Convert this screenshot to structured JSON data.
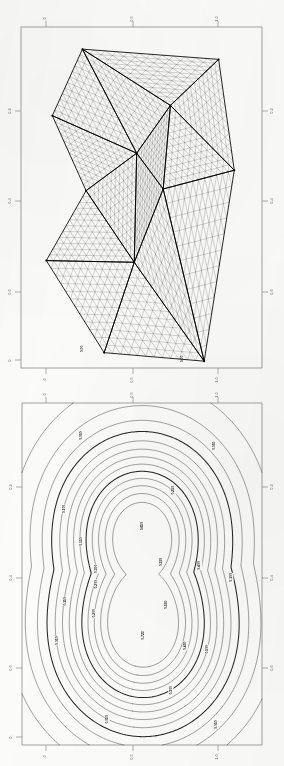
{
  "document": {
    "kind": "scanned-page",
    "background_color": "#fbfbfa",
    "ink_color": "#1b1b1b",
    "axis_color": "#888888",
    "page_width": 284,
    "page_height": 766
  },
  "figures": [
    {
      "id": "mesh-plot",
      "name": "triangular-finite-element-mesh",
      "caption": "",
      "frame": {
        "x": 21,
        "y": 27,
        "width": 241,
        "height": 341
      },
      "axes": {
        "top": {
          "ticks": [
            {
              "label": ".0",
              "pos": 0.105
            },
            {
              "label": "0.5",
              "pos": 0.465
            },
            {
              "label": "1.0",
              "pos": 0.815
            }
          ]
        },
        "bottom": {
          "ticks": [
            {
              "label": ".0",
              "pos": 0.105
            },
            {
              "label": "0.5",
              "pos": 0.465
            },
            {
              "label": "1.0",
              "pos": 0.815
            }
          ]
        },
        "left": {
          "ticks": [
            {
              "label": "0.2",
              "pos": 0.245
            },
            {
              "label": "0.4",
              "pos": 0.51
            },
            {
              "label": "0.6",
              "pos": 0.775
            },
            {
              "label": "0.",
              "pos": 0.975
            }
          ]
        },
        "right": {
          "ticks": [
            {
              "label": "0.2",
              "pos": 0.245
            },
            {
              "label": "0.4",
              "pos": 0.51
            },
            {
              "label": "0.6",
              "pos": 0.775
            }
          ]
        }
      },
      "node_labels": [
        {
          "text": "0.00",
          "x": 0.345,
          "y": 0.958
        },
        {
          "text": "0.00",
          "x": 0.76,
          "y": 0.985
        }
      ]
    },
    {
      "id": "contour-plot",
      "name": "contour-plot-two-peaks",
      "caption": "",
      "frame": {
        "x": 22,
        "y": 403,
        "width": 240,
        "height": 342
      },
      "axes": {
        "top": {
          "ticks": [
            {
              "label": ".0",
              "pos": 0.105
            },
            {
              "label": "0.5",
              "pos": 0.465
            },
            {
              "label": "1.0",
              "pos": 0.815
            }
          ]
        },
        "bottom": {
          "ticks": [
            {
              "label": ".0",
              "pos": 0.105
            },
            {
              "label": "0.5",
              "pos": 0.465
            },
            {
              "label": "1.0",
              "pos": 0.815
            }
          ]
        },
        "left": {
          "ticks": [
            {
              "label": "0.2",
              "pos": 0.245
            },
            {
              "label": "0.4",
              "pos": 0.51
            },
            {
              "label": "0.6",
              "pos": 0.775
            },
            {
              "label": "0.",
              "pos": 0.975
            }
          ]
        },
        "right": {
          "ticks": [
            {
              "label": "0.2",
              "pos": 0.245
            },
            {
              "label": "0.4",
              "pos": 0.51
            },
            {
              "label": "0.6",
              "pos": 0.775
            }
          ]
        }
      }
    }
  ],
  "chart_data": [
    {
      "type": "mesh",
      "title": "",
      "subtitle": "",
      "xlabel": "",
      "ylabel": "",
      "xlim": [
        0.0,
        1.0
      ],
      "ylim": [
        0.0,
        0.8
      ],
      "grid": false,
      "legend": null,
      "description": "Unstructured triangular finite-element mesh on a convex polygonal domain, subdivided into macro-triangles each uniformly refined into many small triangles.",
      "macro_vertices": [
        {
          "id": "v1",
          "x": 0.255,
          "y": 0.935
        },
        {
          "id": "v2",
          "x": 0.82,
          "y": 0.905
        },
        {
          "id": "v3",
          "x": 0.13,
          "y": 0.74
        },
        {
          "id": "v4",
          "x": 0.62,
          "y": 0.77
        },
        {
          "id": "v5",
          "x": 0.885,
          "y": 0.58
        },
        {
          "id": "v6",
          "x": 0.48,
          "y": 0.63
        },
        {
          "id": "v7",
          "x": 0.27,
          "y": 0.52
        },
        {
          "id": "v8",
          "x": 0.59,
          "y": 0.525
        },
        {
          "id": "v9",
          "x": 0.105,
          "y": 0.315
        },
        {
          "id": "v10",
          "x": 0.47,
          "y": 0.31
        },
        {
          "id": "v11",
          "x": 0.345,
          "y": 0.045
        },
        {
          "id": "v12",
          "x": 0.76,
          "y": 0.02
        }
      ],
      "macro_triangles": [
        [
          "v1",
          "v2",
          "v4"
        ],
        [
          "v1",
          "v4",
          "v6"
        ],
        [
          "v1",
          "v6",
          "v3"
        ],
        [
          "v3",
          "v6",
          "v7"
        ],
        [
          "v2",
          "v5",
          "v4"
        ],
        [
          "v4",
          "v5",
          "v8"
        ],
        [
          "v4",
          "v8",
          "v6"
        ],
        [
          "v6",
          "v8",
          "v10"
        ],
        [
          "v6",
          "v10",
          "v7"
        ],
        [
          "v7",
          "v10",
          "v9"
        ],
        [
          "v9",
          "v10",
          "v11"
        ],
        [
          "v10",
          "v8",
          "v12"
        ],
        [
          "v10",
          "v12",
          "v11"
        ],
        [
          "v8",
          "v5",
          "v12"
        ]
      ],
      "refinement_per_edge": 12
    },
    {
      "type": "contour",
      "title": "",
      "subtitle": "",
      "xlabel": "",
      "ylabel": "",
      "xlim": [
        0.0,
        1.0
      ],
      "ylim": [
        0.0,
        0.8
      ],
      "grid": false,
      "legend": null,
      "description": "Contour map of a scalar field with two local maxima (upper and lower peak) connected by a saddle; nested closed isolines with a bold emphasized level.",
      "levels": [
        {
          "value": "0.05",
          "bold": false
        },
        {
          "value": "0.10",
          "bold": false
        },
        {
          "value": "0.15",
          "bold": false
        },
        {
          "value": "0.20",
          "bold": true
        },
        {
          "value": "0.25",
          "bold": false
        },
        {
          "value": "0.30",
          "bold": false
        },
        {
          "value": "0.35",
          "bold": false
        },
        {
          "value": "0.40",
          "bold": false
        },
        {
          "value": "0.45",
          "bold": true
        },
        {
          "value": "0.50",
          "bold": false
        },
        {
          "value": "0.55",
          "bold": false
        },
        {
          "value": "0.60",
          "bold": false
        },
        {
          "value": "0.65",
          "bold": false
        }
      ],
      "peaks": [
        {
          "name": "upper-peak",
          "x": 0.5,
          "y": 0.64,
          "label": "0.650"
        },
        {
          "name": "lower-peak",
          "x": 0.505,
          "y": 0.32,
          "label": "0.723"
        }
      ],
      "inline_labels": [
        {
          "text": "0.050",
          "x": 0.245,
          "y": 0.905
        },
        {
          "text": "0.050",
          "x": 0.8,
          "y": 0.875
        },
        {
          "text": "0.100",
          "x": 0.175,
          "y": 0.69
        },
        {
          "text": "0.650",
          "x": 0.5,
          "y": 0.64
        },
        {
          "text": "0.250",
          "x": 0.63,
          "y": 0.745
        },
        {
          "text": "0.150",
          "x": 0.245,
          "y": 0.595
        },
        {
          "text": "0.300",
          "x": 0.31,
          "y": 0.515
        },
        {
          "text": "0.350",
          "x": 0.58,
          "y": 0.535
        },
        {
          "text": "0.400",
          "x": 0.74,
          "y": 0.525
        },
        {
          "text": "0.100",
          "x": 0.87,
          "y": 0.49
        },
        {
          "text": "0.200",
          "x": 0.31,
          "y": 0.47
        },
        {
          "text": "0.150",
          "x": 0.18,
          "y": 0.42
        },
        {
          "text": "0.723",
          "x": 0.505,
          "y": 0.32
        },
        {
          "text": "0.550",
          "x": 0.6,
          "y": 0.41
        },
        {
          "text": "0.450",
          "x": 0.68,
          "y": 0.29
        },
        {
          "text": "0.050",
          "x": 0.145,
          "y": 0.305
        },
        {
          "text": "0.200",
          "x": 0.3,
          "y": 0.385
        },
        {
          "text": "0.500",
          "x": 0.77,
          "y": 0.28
        },
        {
          "text": "0.300",
          "x": 0.62,
          "y": 0.16
        },
        {
          "text": "0.050",
          "x": 0.355,
          "y": 0.075
        },
        {
          "text": "0.050",
          "x": 0.81,
          "y": 0.06
        }
      ]
    }
  ]
}
